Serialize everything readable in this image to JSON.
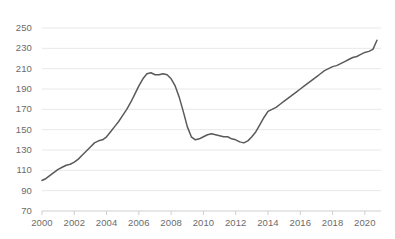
{
  "chart_data": {
    "type": "line",
    "title": "",
    "subtitle": "",
    "xlabel": "",
    "ylabel": "",
    "grid": "horizontal",
    "legend": "none",
    "xlim": [
      2000.0,
      2021.0
    ],
    "ylim": [
      70,
      250
    ],
    "y_ticks": [
      70,
      90,
      110,
      130,
      150,
      170,
      190,
      210,
      230,
      250
    ],
    "x_ticks": [
      2000,
      2002,
      2004,
      2006,
      2008,
      2010,
      2012,
      2014,
      2016,
      2018,
      2020
    ],
    "x_tick_labels": [
      "2000",
      "2002",
      "2004",
      "2006",
      "2008",
      "2010",
      "2012",
      "2014",
      "2016",
      "2018",
      "2020"
    ],
    "y_tick_labels": [
      "70",
      "90",
      "110",
      "130",
      "150",
      "170",
      "190",
      "210",
      "230",
      "250"
    ],
    "series": [
      {
        "name": "index",
        "color": "#5a5a5a",
        "x": [
          2000.0,
          2000.25,
          2000.5,
          2000.75,
          2001.0,
          2001.25,
          2001.5,
          2001.75,
          2002.0,
          2002.25,
          2002.5,
          2002.75,
          2003.0,
          2003.25,
          2003.5,
          2003.75,
          2004.0,
          2004.25,
          2004.5,
          2004.75,
          2005.0,
          2005.25,
          2005.5,
          2005.75,
          2006.0,
          2006.25,
          2006.5,
          2006.75,
          2007.0,
          2007.25,
          2007.5,
          2007.75,
          2008.0,
          2008.25,
          2008.5,
          2008.75,
          2009.0,
          2009.25,
          2009.5,
          2009.75,
          2010.0,
          2010.25,
          2010.5,
          2010.75,
          2011.0,
          2011.25,
          2011.5,
          2011.75,
          2012.0,
          2012.25,
          2012.5,
          2012.75,
          2013.0,
          2013.25,
          2013.5,
          2013.75,
          2014.0,
          2014.25,
          2014.5,
          2014.75,
          2015.0,
          2015.25,
          2015.5,
          2015.75,
          2016.0,
          2016.25,
          2016.5,
          2016.75,
          2017.0,
          2017.25,
          2017.5,
          2017.75,
          2018.0,
          2018.25,
          2018.5,
          2018.75,
          2019.0,
          2019.25,
          2019.5,
          2019.75,
          2020.0,
          2020.25,
          2020.5,
          2020.75
        ],
        "values": [
          100,
          102,
          105,
          108,
          111,
          113,
          115,
          116,
          118,
          121,
          125,
          129,
          133,
          137,
          139,
          140,
          143,
          148,
          153,
          158,
          164,
          170,
          177,
          185,
          193,
          200,
          205,
          206,
          204,
          204,
          205,
          204,
          200,
          193,
          182,
          168,
          153,
          143,
          140,
          141,
          143,
          145,
          146,
          145,
          144,
          143,
          143,
          141,
          140,
          138,
          137,
          139,
          143,
          148,
          155,
          162,
          168,
          170,
          172,
          175,
          178,
          181,
          184,
          187,
          190,
          193,
          196,
          199,
          202,
          205,
          208,
          210,
          212,
          213,
          215,
          217,
          219,
          221,
          222,
          224,
          226,
          227,
          229,
          238
        ]
      }
    ]
  }
}
